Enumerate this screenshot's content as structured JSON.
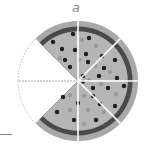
{
  "figure": {
    "label": "a",
    "total_slices": 8,
    "present_slices": 6,
    "missing_slices": 2,
    "missing_positions": [
      "upper-left",
      "lower-left"
    ],
    "colors": {
      "crust": "#a9a9a9",
      "sauce": "#4a4a4a",
      "cheese": "#b8b8b8",
      "topping_dark": "#1e1e1e",
      "topping_light": "#9a9a9a",
      "slice_gap": "#ffffff",
      "missing_outline": "#b0b0b0"
    }
  }
}
